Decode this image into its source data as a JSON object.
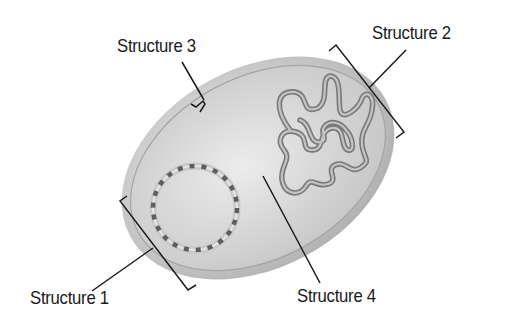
{
  "diagram": {
    "colors": {
      "background": "#ffffff",
      "cell_body": "#c8c8c8",
      "cell_highlight": "#ececec",
      "cell_edge": "#9a9a9a",
      "dna_strand": "#6e6e6e",
      "leader_line": "#1a1a1a"
    },
    "labels": [
      {
        "id": "structure-1",
        "text": "Structure 1",
        "points_to": "circular DNA (plasmid) bracketed"
      },
      {
        "id": "structure-2",
        "text": "Structure 2",
        "points_to": "coiled DNA region (nucleoid) bracketed"
      },
      {
        "id": "structure-3",
        "text": "Structure 3",
        "points_to": "cell membrane/wall layer"
      },
      {
        "id": "structure-4",
        "text": "Structure 4",
        "points_to": "cytoplasm"
      }
    ]
  }
}
